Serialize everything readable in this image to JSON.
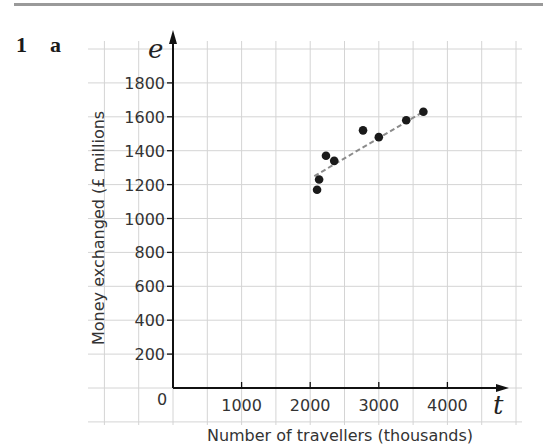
{
  "question": {
    "number": "1",
    "part": "a"
  },
  "chart_data": {
    "type": "scatter",
    "title": "",
    "xlabel": "Number of travellers (thousands)",
    "ylabel": "Money exchanged (£ millions",
    "x_axis_symbol": "t",
    "y_axis_symbol": "e",
    "origin_label": "0",
    "xlim": [
      -1000,
      5000
    ],
    "ylim": [
      -200,
      1900
    ],
    "x_ticks": [
      1000,
      2000,
      3000,
      4000
    ],
    "x_tick_labels": [
      "1000",
      "2000",
      "3000",
      "4000"
    ],
    "y_ticks": [
      200,
      400,
      600,
      800,
      1000,
      1200,
      1400,
      1600,
      1800
    ],
    "y_tick_labels": [
      "200",
      "400",
      "600",
      "800",
      "1000",
      "1200",
      "1400",
      "1600",
      "1800"
    ],
    "grid": true,
    "grid_x_step": 500,
    "grid_y_step": 200,
    "points": [
      {
        "x": 2100,
        "y": 1170
      },
      {
        "x": 2130,
        "y": 1230
      },
      {
        "x": 2230,
        "y": 1370
      },
      {
        "x": 2350,
        "y": 1340
      },
      {
        "x": 2770,
        "y": 1520
      },
      {
        "x": 3000,
        "y": 1480
      },
      {
        "x": 3400,
        "y": 1580
      },
      {
        "x": 3650,
        "y": 1630
      }
    ],
    "trend_line": {
      "style": "dashed",
      "from": {
        "x": 2060,
        "y": 1250
      },
      "to": {
        "x": 3650,
        "y": 1630
      }
    },
    "colors": {
      "points": "#1a1a1a",
      "trend_line": "#8c8c8c",
      "grid": "#d4d4d4",
      "axes": "#111111"
    }
  }
}
